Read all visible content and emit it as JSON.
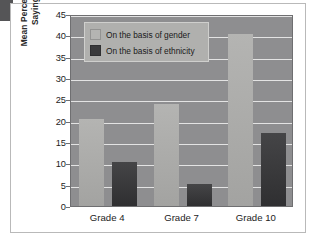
{
  "figure": {
    "y_axis_title_line1": "Mean Percentage Saying",
    "y_axis_title_line2": "“It’s OK” to Exclude"
  },
  "legend": {
    "position": "top-left-inside",
    "items": [
      {
        "label": "On the basis of gender",
        "swatch_name": "legend-swatch-gender",
        "color": "#b4b4b2"
      },
      {
        "label": "On the basis of ethnicity",
        "swatch_name": "legend-swatch-ethnicity",
        "color": "#3a3a3c"
      }
    ]
  },
  "chart_data": {
    "type": "bar",
    "title": "",
    "xlabel": "",
    "ylabel": "Mean Percentage Saying “It’s OK” to Exclude",
    "categories": [
      "Grade 4",
      "Grade 7",
      "Grade 10"
    ],
    "series": [
      {
        "name": "On the basis of gender",
        "color": "#b4b4b2",
        "values": [
          20.3,
          24,
          40.2
        ]
      },
      {
        "name": "On the basis of ethnicity",
        "color": "#3a3a3c",
        "values": [
          10.2,
          5.2,
          17.2
        ]
      }
    ],
    "ylim": [
      0,
      45
    ],
    "ytick_labels": [
      "0",
      "5",
      "10",
      "15",
      "20",
      "25",
      "30",
      "35",
      "40",
      "45"
    ],
    "ytick_values": [
      0,
      5,
      10,
      15,
      20,
      25,
      30,
      35,
      40,
      45
    ],
    "grid": true,
    "grid_axis": "y",
    "plot_background": "#8e8e90",
    "legend_position": "upper left"
  }
}
